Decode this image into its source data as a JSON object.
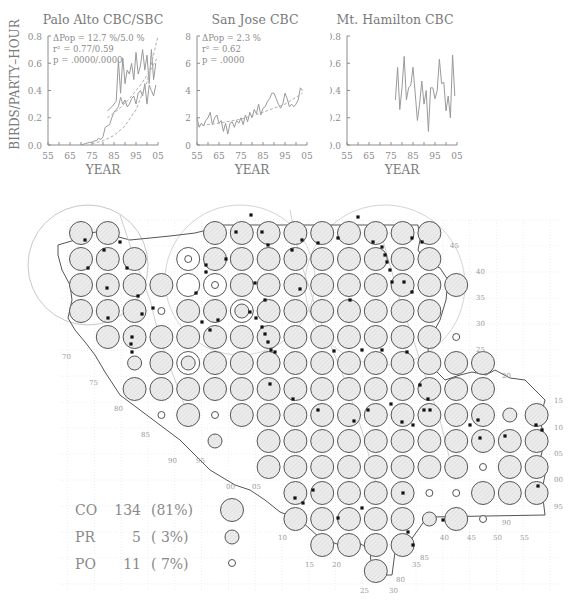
{
  "chart_data": [
    {
      "type": "line",
      "title": "Palo Alto CBC/SBC",
      "xlabel": "YEAR",
      "ylabel": "BIRDS/PARTY–HOUR",
      "xlim": [
        55,
        105
      ],
      "ylim": [
        0,
        0.8
      ],
      "xticks": [
        "55",
        "65",
        "75",
        "85",
        "95",
        "05"
      ],
      "yticks": [
        "0.0",
        "0.2",
        "0.4",
        "0.6",
        "0.8"
      ],
      "annotations": [
        "ΔPop = 12.7 %/5.0 %",
        "r² = 0.77/0.59",
        "p = .0000/.0000"
      ],
      "series": [
        {
          "name": "CBC",
          "style": "solid",
          "x": [
            70,
            72,
            74,
            75,
            76,
            77,
            78,
            79,
            80,
            81,
            82,
            83,
            84,
            85,
            86,
            87,
            88,
            89,
            90,
            91,
            92,
            93,
            94,
            95,
            96,
            97,
            98,
            99,
            100,
            101,
            102,
            103,
            104
          ],
          "y": [
            0.0,
            0.01,
            0.02,
            0.02,
            0.03,
            0.03,
            0.05,
            0.04,
            0.06,
            0.13,
            0.14,
            0.15,
            0.2,
            0.24,
            0.26,
            0.28,
            0.35,
            0.3,
            0.33,
            0.28,
            0.3,
            0.34,
            0.36,
            0.3,
            0.38,
            0.4,
            0.36,
            0.45,
            0.3,
            0.44,
            0.4,
            0.36,
            0.44
          ]
        },
        {
          "name": "SBC",
          "style": "solid",
          "x": [
            82,
            84,
            86,
            87,
            88,
            89,
            90,
            91,
            92,
            93,
            94,
            95,
            96,
            97,
            98,
            99,
            100,
            101,
            102,
            103,
            104
          ],
          "y": [
            0.25,
            0.28,
            0.32,
            0.62,
            0.38,
            0.64,
            0.45,
            0.55,
            0.52,
            0.6,
            0.48,
            0.68,
            0.52,
            0.58,
            0.7,
            0.55,
            0.66,
            0.45,
            0.7,
            0.48,
            0.6
          ]
        },
        {
          "name": "CBC trend",
          "style": "dashed",
          "x": [
            75,
            80,
            85,
            90,
            95,
            100,
            105
          ],
          "y": [
            0.01,
            0.03,
            0.07,
            0.14,
            0.26,
            0.46,
            0.8
          ]
        },
        {
          "name": "SBC trend",
          "style": "dashed",
          "x": [
            82,
            87,
            92,
            97,
            102,
            105
          ],
          "y": [
            0.2,
            0.26,
            0.34,
            0.44,
            0.56,
            0.65
          ]
        }
      ]
    },
    {
      "type": "line",
      "title": "San Jose CBC",
      "xlabel": "YEAR",
      "ylabel": "",
      "xlim": [
        55,
        105
      ],
      "ylim": [
        0,
        0.8
      ],
      "xticks": [
        "55",
        "65",
        "75",
        "85",
        "95",
        "05"
      ],
      "yticks": [
        "0.0",
        "0.2",
        "0.4",
        "0.6",
        "0.8"
      ],
      "annotations": [
        "ΔPop =   2.3 %",
        "r² = 0.62",
        "p = .0000"
      ],
      "series": [
        {
          "name": "CBC",
          "style": "solid",
          "x": [
            55,
            56,
            57,
            58,
            59,
            60,
            61,
            62,
            63,
            64,
            65,
            66,
            67,
            68,
            69,
            70,
            71,
            72,
            73,
            74,
            75,
            76,
            77,
            78,
            79,
            80,
            81,
            82,
            83,
            84,
            85,
            86,
            87,
            88,
            89,
            90,
            91,
            92,
            93,
            94,
            95,
            96,
            97,
            98,
            99,
            100,
            101,
            102,
            103
          ],
          "y": [
            0.2,
            0.13,
            0.16,
            0.14,
            0.18,
            0.2,
            0.24,
            0.15,
            0.2,
            0.22,
            0.16,
            0.18,
            0.1,
            0.16,
            0.08,
            0.16,
            0.17,
            0.13,
            0.18,
            0.16,
            0.2,
            0.15,
            0.22,
            0.17,
            0.24,
            0.2,
            0.26,
            0.23,
            0.3,
            0.22,
            0.27,
            0.28,
            0.32,
            0.34,
            0.38,
            0.38,
            0.34,
            0.3,
            0.27,
            0.3,
            0.38,
            0.34,
            0.28,
            0.3,
            0.28,
            0.3,
            0.33,
            0.42,
            0.4
          ]
        },
        {
          "name": "trend",
          "style": "dashed",
          "x": [
            55,
            65,
            75,
            85,
            95,
            103
          ],
          "y": [
            0.14,
            0.16,
            0.19,
            0.24,
            0.3,
            0.38
          ]
        }
      ]
    },
    {
      "type": "line",
      "title": "Mt. Hamilton CBC",
      "xlabel": "YEAR",
      "ylabel": "",
      "xlim": [
        55,
        105
      ],
      "ylim": [
        0,
        0.8
      ],
      "xticks": [
        "55",
        "65",
        "75",
        "85",
        "95",
        "05"
      ],
      "yticks": [
        "0.0",
        "0.2",
        "0.4",
        "0.6",
        "0.8"
      ],
      "annotations": [],
      "series": [
        {
          "name": "CBC",
          "style": "solid",
          "x": [
            77,
            78,
            79,
            80,
            81,
            82,
            83,
            84,
            85,
            86,
            87,
            88,
            89,
            90,
            91,
            92,
            93,
            94,
            95,
            96,
            97,
            98,
            99,
            100,
            101,
            102,
            103,
            104
          ],
          "y": [
            0.33,
            0.57,
            0.26,
            0.42,
            0.65,
            0.33,
            0.42,
            0.44,
            0.57,
            0.38,
            0.18,
            0.3,
            0.47,
            0.3,
            0.4,
            0.1,
            0.42,
            0.42,
            0.34,
            0.4,
            0.63,
            0.45,
            0.46,
            0.25,
            0.36,
            0.2,
            0.66,
            0.36
          ]
        }
      ]
    }
  ],
  "map": {
    "legend": [
      {
        "code": "CO",
        "count": "134",
        "pct": "(81%)",
        "symbol": "large-circle"
      },
      {
        "code": "PR",
        "count": "5",
        "pct": "( 3%)",
        "symbol": "medium-circle"
      },
      {
        "code": "PO",
        "count": "11",
        "pct": "( 7%)",
        "symbol": "small-circle"
      }
    ],
    "grid": {
      "x0": 81,
      "dx": 26.8,
      "y0": 233,
      "dy": 26,
      "rows": [
        "CC---CCCCCCCCC----",
        "CCC-pCCCCCCCCC----",
        "CCCCEpCCCCCCCCC---",
        "CCCoCCDCCCCCCC----",
        "-CCCCCCCCCCCCCo---",
        "--RCDCCCCCCCCCCC--",
        "--CCCCCCCCCCCCCC--",
        "---oCoCCCCCCCCCCRC",
        "-----R-CCCCCCCCCCC",
        "-------CCCCCCCCoCC",
        "--------CCCCCooCCC",
        "--------CCCCCRCo--",
        "---------CCCC-----",
        "-----------C------"
      ],
      "legend_codes": {
        "C": "CO",
        "R": "PR",
        "o": "PO",
        "D": "CO+PR",
        "p": "CO+PR-inner",
        "E": "empty-block"
      }
    },
    "grid_labels": [
      {
        "t": "70",
        "x": 62,
        "y": 359
      },
      {
        "t": "75",
        "x": 89,
        "y": 385
      },
      {
        "t": "80",
        "x": 114,
        "y": 411
      },
      {
        "t": "85",
        "x": 141,
        "y": 437
      },
      {
        "t": "90",
        "x": 168,
        "y": 463
      },
      {
        "t": "95",
        "x": 196,
        "y": 463
      },
      {
        "t": "00",
        "x": 226,
        "y": 489
      },
      {
        "t": "05",
        "x": 252,
        "y": 489
      },
      {
        "t": "10",
        "x": 278,
        "y": 540
      },
      {
        "t": "15",
        "x": 305,
        "y": 567
      },
      {
        "t": "20",
        "x": 332,
        "y": 567
      },
      {
        "t": "25",
        "x": 360,
        "y": 593
      },
      {
        "t": "30",
        "x": 389,
        "y": 593
      },
      {
        "t": "80",
        "x": 396,
        "y": 582
      },
      {
        "t": "35",
        "x": 412,
        "y": 567
      },
      {
        "t": "85",
        "x": 420,
        "y": 560
      },
      {
        "t": "40",
        "x": 440,
        "y": 540
      },
      {
        "t": "45",
        "x": 467,
        "y": 540
      },
      {
        "t": "50",
        "x": 493,
        "y": 540
      },
      {
        "t": "90",
        "x": 502,
        "y": 525
      },
      {
        "t": "55",
        "x": 520,
        "y": 540
      },
      {
        "t": "45",
        "x": 450,
        "y": 248
      },
      {
        "t": "40",
        "x": 476,
        "y": 274
      },
      {
        "t": "35",
        "x": 476,
        "y": 300
      },
      {
        "t": "30",
        "x": 476,
        "y": 326
      },
      {
        "t": "25",
        "x": 476,
        "y": 352
      },
      {
        "t": "20",
        "x": 502,
        "y": 378
      },
      {
        "t": "15",
        "x": 554,
        "y": 403
      },
      {
        "t": "10",
        "x": 554,
        "y": 430
      },
      {
        "t": "05",
        "x": 554,
        "y": 456
      },
      {
        "t": "00",
        "x": 554,
        "y": 482
      },
      {
        "t": "95",
        "x": 554,
        "y": 509
      }
    ]
  }
}
